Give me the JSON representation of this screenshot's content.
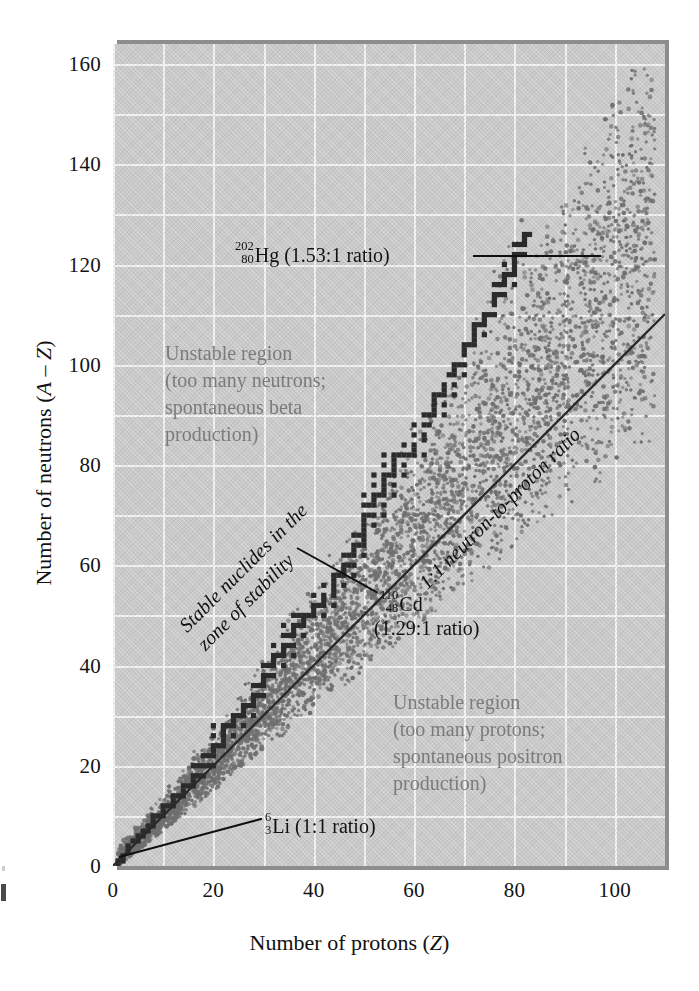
{
  "figure": {
    "plot_bg_color": "#c9c9c9",
    "grid_color": "#f2f2f2",
    "stable_marker_color": "#2b2b2b",
    "unstable_dot_color": "#6e6e6e",
    "note_color": "#7b7b7b"
  },
  "axes": {
    "x_title_prefix": "Number of protons (",
    "x_title_italic": "Z",
    "x_title_suffix": ")",
    "x_title_full": "Number of protons (Z)",
    "y_title_prefix": "Number of neutrons (",
    "y_title_italic_a": "A",
    "y_title_dash": " – ",
    "y_title_italic_z": "Z",
    "y_title_suffix": ")",
    "y_title_full": "Number of neutrons (A – Z)",
    "x_ticks": [
      "0",
      "20",
      "40",
      "60",
      "80",
      "100"
    ],
    "y_ticks": [
      "0",
      "20",
      "40",
      "60",
      "80",
      "100",
      "120",
      "140",
      "160"
    ]
  },
  "annotations": {
    "unstable_neutrons": "Unstable region\n(too many neutrons;\nspontaneous beta\nproduction)",
    "unstable_protons": "Unstable region\n(too many protons;\nspontaneous positron\nproduction)",
    "stable_band": "Stable nuclides in the\nzone of stability",
    "ratio_line": "1:1 neutron-to-proton ratio",
    "hg": {
      "mass": "202",
      "atomic": "80",
      "symbol": "Hg",
      "text": " (1.53:1 ratio)"
    },
    "cd": {
      "mass": "110",
      "atomic": "48",
      "symbol": "Cd",
      "text": "",
      "line2": "(1.29:1 ratio)"
    },
    "li": {
      "mass": "6",
      "atomic": "3",
      "symbol": "Li",
      "text": " (1:1 ratio)"
    }
  },
  "chart_data": {
    "type": "scatter",
    "title": "",
    "xlabel": "Number of protons (Z)",
    "ylabel": "Number of neutrons (A – Z)",
    "xlim": [
      0,
      110
    ],
    "ylim": [
      0,
      164
    ],
    "grid": true,
    "grid_step_x": 10,
    "grid_step_y": 10,
    "legend": "none",
    "series": [
      {
        "name": "Stable nuclides (band of stability)",
        "marker": "filled-square",
        "color": "#2b2b2b",
        "description": "Belt of stable nuclides stepping upward; N≈Z for light elements, N/Z rises to ~1.5 near Z=83",
        "points": [
          [
            1,
            0
          ],
          [
            1,
            1
          ],
          [
            2,
            1
          ],
          [
            2,
            2
          ],
          [
            3,
            3
          ],
          [
            3,
            4
          ],
          [
            4,
            5
          ],
          [
            5,
            5
          ],
          [
            5,
            6
          ],
          [
            6,
            6
          ],
          [
            6,
            7
          ],
          [
            7,
            7
          ],
          [
            7,
            8
          ],
          [
            8,
            8
          ],
          [
            8,
            9
          ],
          [
            8,
            10
          ],
          [
            9,
            10
          ],
          [
            10,
            10
          ],
          [
            10,
            11
          ],
          [
            10,
            12
          ],
          [
            11,
            12
          ],
          [
            12,
            12
          ],
          [
            12,
            13
          ],
          [
            12,
            14
          ],
          [
            13,
            14
          ],
          [
            14,
            14
          ],
          [
            14,
            15
          ],
          [
            14,
            16
          ],
          [
            15,
            16
          ],
          [
            16,
            16
          ],
          [
            16,
            17
          ],
          [
            16,
            18
          ],
          [
            16,
            20
          ],
          [
            17,
            18
          ],
          [
            17,
            20
          ],
          [
            18,
            18
          ],
          [
            18,
            20
          ],
          [
            18,
            22
          ],
          [
            19,
            20
          ],
          [
            19,
            22
          ],
          [
            20,
            20
          ],
          [
            20,
            22
          ],
          [
            20,
            23
          ],
          [
            20,
            24
          ],
          [
            20,
            26
          ],
          [
            20,
            28
          ],
          [
            21,
            24
          ],
          [
            22,
            24
          ],
          [
            22,
            25
          ],
          [
            22,
            26
          ],
          [
            22,
            27
          ],
          [
            22,
            28
          ],
          [
            23,
            28
          ],
          [
            24,
            26
          ],
          [
            24,
            28
          ],
          [
            24,
            29
          ],
          [
            24,
            30
          ],
          [
            25,
            30
          ],
          [
            26,
            28
          ],
          [
            26,
            30
          ],
          [
            26,
            31
          ],
          [
            26,
            32
          ],
          [
            27,
            32
          ],
          [
            28,
            30
          ],
          [
            28,
            32
          ],
          [
            28,
            33
          ],
          [
            28,
            34
          ],
          [
            28,
            36
          ],
          [
            29,
            34
          ],
          [
            29,
            36
          ],
          [
            30,
            34
          ],
          [
            30,
            36
          ],
          [
            30,
            37
          ],
          [
            30,
            38
          ],
          [
            30,
            40
          ],
          [
            31,
            38
          ],
          [
            31,
            40
          ],
          [
            32,
            38
          ],
          [
            32,
            40
          ],
          [
            32,
            41
          ],
          [
            32,
            42
          ],
          [
            32,
            44
          ],
          [
            33,
            42
          ],
          [
            34,
            40
          ],
          [
            34,
            42
          ],
          [
            34,
            43
          ],
          [
            34,
            44
          ],
          [
            34,
            46
          ],
          [
            34,
            48
          ],
          [
            35,
            44
          ],
          [
            35,
            46
          ],
          [
            36,
            42
          ],
          [
            36,
            44
          ],
          [
            36,
            46
          ],
          [
            36,
            47
          ],
          [
            36,
            48
          ],
          [
            36,
            50
          ],
          [
            37,
            48
          ],
          [
            37,
            50
          ],
          [
            38,
            46
          ],
          [
            38,
            48
          ],
          [
            38,
            49
          ],
          [
            38,
            50
          ],
          [
            39,
            50
          ],
          [
            40,
            50
          ],
          [
            40,
            51
          ],
          [
            40,
            52
          ],
          [
            40,
            54
          ],
          [
            41,
            52
          ],
          [
            42,
            50
          ],
          [
            42,
            52
          ],
          [
            42,
            53
          ],
          [
            42,
            54
          ],
          [
            42,
            56
          ],
          [
            44,
            52
          ],
          [
            44,
            54
          ],
          [
            44,
            55
          ],
          [
            44,
            56
          ],
          [
            44,
            57
          ],
          [
            44,
            58
          ],
          [
            45,
            58
          ],
          [
            46,
            56
          ],
          [
            46,
            58
          ],
          [
            46,
            59
          ],
          [
            46,
            60
          ],
          [
            46,
            62
          ],
          [
            47,
            60
          ],
          [
            47,
            62
          ],
          [
            48,
            58
          ],
          [
            48,
            60
          ],
          [
            48,
            62
          ],
          [
            48,
            63
          ],
          [
            48,
            64
          ],
          [
            48,
            66
          ],
          [
            49,
            64
          ],
          [
            49,
            66
          ],
          [
            50,
            62
          ],
          [
            50,
            64
          ],
          [
            50,
            65
          ],
          [
            50,
            66
          ],
          [
            50,
            67
          ],
          [
            50,
            68
          ],
          [
            50,
            69
          ],
          [
            50,
            70
          ],
          [
            50,
            72
          ],
          [
            50,
            74
          ],
          [
            51,
            70
          ],
          [
            51,
            72
          ],
          [
            52,
            68
          ],
          [
            52,
            70
          ],
          [
            52,
            72
          ],
          [
            52,
            73
          ],
          [
            52,
            74
          ],
          [
            52,
            76
          ],
          [
            52,
            78
          ],
          [
            53,
            74
          ],
          [
            54,
            70
          ],
          [
            54,
            72
          ],
          [
            54,
            74
          ],
          [
            54,
            75
          ],
          [
            54,
            76
          ],
          [
            54,
            77
          ],
          [
            54,
            78
          ],
          [
            54,
            80
          ],
          [
            54,
            82
          ],
          [
            55,
            78
          ],
          [
            56,
            74
          ],
          [
            56,
            76
          ],
          [
            56,
            78
          ],
          [
            56,
            79
          ],
          [
            56,
            80
          ],
          [
            56,
            81
          ],
          [
            56,
            82
          ],
          [
            57,
            82
          ],
          [
            58,
            78
          ],
          [
            58,
            80
          ],
          [
            58,
            82
          ],
          [
            58,
            84
          ],
          [
            59,
            82
          ],
          [
            60,
            82
          ],
          [
            60,
            83
          ],
          [
            60,
            84
          ],
          [
            60,
            86
          ],
          [
            60,
            88
          ],
          [
            62,
            82
          ],
          [
            62,
            85
          ],
          [
            62,
            86
          ],
          [
            62,
            88
          ],
          [
            62,
            90
          ],
          [
            63,
            88
          ],
          [
            63,
            90
          ],
          [
            64,
            90
          ],
          [
            64,
            91
          ],
          [
            64,
            92
          ],
          [
            64,
            93
          ],
          [
            64,
            94
          ],
          [
            65,
            94
          ],
          [
            66,
            90
          ],
          [
            66,
            92
          ],
          [
            66,
            94
          ],
          [
            66,
            95
          ],
          [
            66,
            96
          ],
          [
            67,
            98
          ],
          [
            68,
            94
          ],
          [
            68,
            96
          ],
          [
            68,
            98
          ],
          [
            68,
            99
          ],
          [
            68,
            100
          ],
          [
            69,
            100
          ],
          [
            70,
            98
          ],
          [
            70,
            100
          ],
          [
            70,
            102
          ],
          [
            70,
            103
          ],
          [
            70,
            104
          ],
          [
            71,
            104
          ],
          [
            72,
            104
          ],
          [
            72,
            105
          ],
          [
            72,
            106
          ],
          [
            72,
            107
          ],
          [
            72,
            108
          ],
          [
            73,
            108
          ],
          [
            74,
            106
          ],
          [
            74,
            108
          ],
          [
            74,
            109
          ],
          [
            74,
            110
          ],
          [
            75,
            110
          ],
          [
            76,
            110
          ],
          [
            76,
            112
          ],
          [
            76,
            113
          ],
          [
            76,
            114
          ],
          [
            76,
            116
          ],
          [
            77,
            114
          ],
          [
            77,
            116
          ],
          [
            78,
            114
          ],
          [
            78,
            116
          ],
          [
            78,
            117
          ],
          [
            78,
            118
          ],
          [
            78,
            120
          ],
          [
            79,
            118
          ],
          [
            80,
            116
          ],
          [
            80,
            118
          ],
          [
            80,
            119
          ],
          [
            80,
            120
          ],
          [
            80,
            121
          ],
          [
            80,
            122
          ],
          [
            80,
            124
          ],
          [
            81,
            122
          ],
          [
            81,
            124
          ],
          [
            82,
            122
          ],
          [
            82,
            124
          ],
          [
            82,
            125
          ],
          [
            82,
            126
          ],
          [
            83,
            126
          ]
        ]
      },
      {
        "name": "Unstable / radioactive nuclides (stippled halo)",
        "marker": "dot",
        "color": "#6e6e6e",
        "description": "Dense stipple cloud flanking the stable belt on both neutron-rich and proton-rich sides, widening toward high Z and extending to N≈158 at Z≈108"
      }
    ],
    "reference_lines": [
      {
        "name": "1:1 neutron-to-proton ratio",
        "type": "line",
        "from": [
          0,
          0
        ],
        "to": [
          110,
          110
        ],
        "color": "#2a2a2a",
        "label": "1:1 neutron-to-proton ratio"
      }
    ],
    "annotated_points": [
      {
        "label": "202-80 Hg (1.53:1 ratio)",
        "x": 80,
        "y": 122
      },
      {
        "label": "110-48 Cd (1.29:1 ratio)",
        "x": 48,
        "y": 62
      },
      {
        "label": "6-3 Li (1:1 ratio)",
        "x": 3,
        "y": 3
      }
    ]
  }
}
